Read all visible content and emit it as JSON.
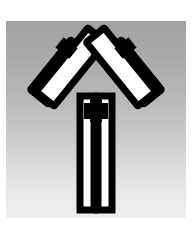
{
  "figure": {
    "title": "Antibody (immunoglobulin) schematic",
    "panel_background_top": "#9b9b9b",
    "panel_background_bottom": "#eeeeee",
    "outline_color": "#000000",
    "fill_color": "#ffffff",
    "page_background": "#ffffff"
  },
  "structure": {
    "shape": "Y",
    "parts": [
      {
        "id": "left-light-chain",
        "label": "Left light chain",
        "side": "left",
        "position": "outer",
        "color": "#ffffff",
        "outline": "#000000"
      },
      {
        "id": "left-heavy-chain-arm",
        "label": "Left heavy chain arm",
        "side": "left",
        "position": "inner",
        "color": "#ffffff",
        "outline": "#000000"
      },
      {
        "id": "left-disulfide-link",
        "label": "Left interchain link",
        "side": "left",
        "color": "#000000"
      },
      {
        "id": "right-light-chain",
        "label": "Right light chain",
        "side": "right",
        "position": "outer",
        "color": "#ffffff",
        "outline": "#000000"
      },
      {
        "id": "right-heavy-chain-arm",
        "label": "Right heavy chain arm",
        "side": "right",
        "position": "inner",
        "color": "#ffffff",
        "outline": "#000000"
      },
      {
        "id": "right-disulfide-link",
        "label": "Right interchain link",
        "side": "right",
        "color": "#000000"
      },
      {
        "id": "hinge-region",
        "label": "Hinge region",
        "side": "center",
        "color": "#000000"
      },
      {
        "id": "fc-stem-left",
        "label": "Fc stem left chain",
        "side": "center",
        "color": "#ffffff",
        "outline": "#000000"
      },
      {
        "id": "fc-stem-right",
        "label": "Fc stem right chain",
        "side": "center",
        "color": "#ffffff",
        "outline": "#000000"
      }
    ]
  }
}
